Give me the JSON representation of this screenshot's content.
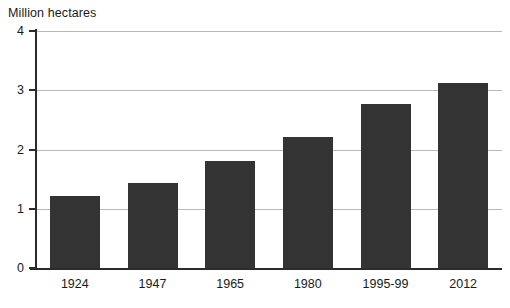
{
  "chart_data": {
    "type": "bar",
    "title": "",
    "ylabel": "Million hectares",
    "xlabel": "",
    "categories": [
      "1924",
      "1947",
      "1965",
      "1980",
      "1995-99",
      "2012"
    ],
    "values": [
      1.22,
      1.44,
      1.81,
      2.21,
      2.77,
      3.12
    ],
    "ylim": [
      0,
      4
    ],
    "yticks": [
      "0",
      "1",
      "2",
      "3",
      "4"
    ],
    "ytick_values": [
      0,
      1,
      2,
      3,
      4
    ],
    "grid": "horizontal",
    "legend": "none",
    "bar_color": "#333333",
    "gridline_color": "#b8b8b8",
    "axis_color": "#2b2b2b",
    "background_color": "#ffffff"
  }
}
